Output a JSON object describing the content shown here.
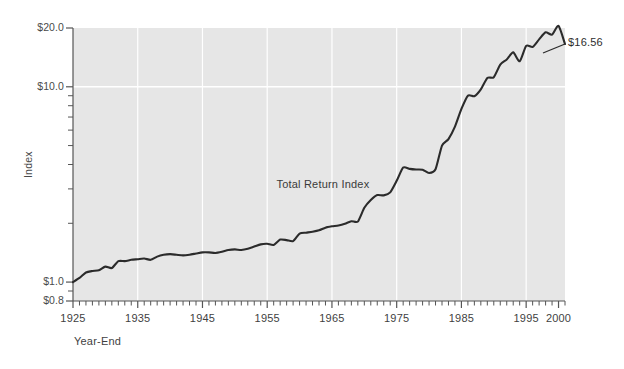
{
  "chart_data": {
    "type": "line",
    "title": "",
    "subtitle": "",
    "xlabel": "Year-End",
    "ylabel": "Index",
    "yscale": "log",
    "ylim": [
      0.8,
      20.0
    ],
    "xlim": [
      1925,
      2001
    ],
    "grid": true,
    "legend_position": "none",
    "y_ticks_major": [
      "$20.0",
      "$10.0",
      "$1.0",
      "$0.8"
    ],
    "y_tick_values": [
      20.0,
      10.0,
      1.0,
      0.8
    ],
    "y_ticks_minor_values": [
      9,
      8,
      7,
      6,
      5,
      4,
      3,
      2,
      0.9
    ],
    "x_ticks_major": [
      "1925",
      "1935",
      "1945",
      "1955",
      "1965",
      "1975",
      "1985",
      "1995",
      "2000"
    ],
    "x_tick_values": [
      1925,
      1935,
      1945,
      1955,
      1965,
      1975,
      1985,
      1995,
      2000
    ],
    "x_minor_tick_interval": 1,
    "gridline_years": [
      1935,
      1945,
      1955,
      1965,
      1975,
      1985,
      1995
    ],
    "gridline_values": [
      10.0
    ],
    "annotations": [
      {
        "text": "Total Return Index",
        "x": 1964,
        "y": 3.1
      },
      {
        "text": "$16.56",
        "x": 2001,
        "y": 16.56
      }
    ],
    "series": [
      {
        "name": "Total Return Index",
        "color": "#2b2b2b",
        "x": [
          1925,
          1926,
          1927,
          1928,
          1929,
          1930,
          1931,
          1932,
          1933,
          1934,
          1935,
          1936,
          1937,
          1938,
          1939,
          1940,
          1941,
          1942,
          1943,
          1944,
          1945,
          1946,
          1947,
          1948,
          1949,
          1950,
          1951,
          1952,
          1953,
          1954,
          1955,
          1956,
          1957,
          1958,
          1959,
          1960,
          1961,
          1962,
          1963,
          1964,
          1965,
          1966,
          1967,
          1968,
          1969,
          1970,
          1971,
          1972,
          1973,
          1974,
          1975,
          1976,
          1977,
          1978,
          1979,
          1980,
          1981,
          1982,
          1983,
          1984,
          1985,
          1986,
          1987,
          1988,
          1989,
          1990,
          1991,
          1992,
          1993,
          1994,
          1995,
          1996,
          1997,
          1998,
          1999,
          2000,
          2001
        ],
        "values": [
          1.0,
          1.05,
          1.12,
          1.14,
          1.15,
          1.2,
          1.18,
          1.28,
          1.28,
          1.3,
          1.31,
          1.32,
          1.3,
          1.35,
          1.38,
          1.39,
          1.38,
          1.37,
          1.38,
          1.4,
          1.42,
          1.42,
          1.41,
          1.43,
          1.46,
          1.47,
          1.46,
          1.48,
          1.52,
          1.56,
          1.57,
          1.55,
          1.65,
          1.64,
          1.62,
          1.77,
          1.79,
          1.81,
          1.84,
          1.9,
          1.93,
          1.95,
          1.99,
          2.05,
          2.04,
          2.4,
          2.63,
          2.79,
          2.78,
          2.88,
          3.3,
          3.86,
          3.8,
          3.77,
          3.76,
          3.62,
          3.78,
          5.0,
          5.4,
          6.25,
          7.7,
          9.0,
          8.95,
          9.7,
          11.1,
          11.2,
          13.0,
          13.8,
          15.0,
          13.5,
          16.2,
          16.0,
          17.5,
          19.0,
          18.5,
          20.5,
          16.56
        ]
      }
    ]
  },
  "axis": {
    "y_title": "Index",
    "x_title": "Year-End"
  },
  "colors": {
    "plot_background": "#e6e6e6",
    "gridline": "#ffffff",
    "axis_line": "#555555",
    "series_line": "#2b2b2b",
    "page_background": "#ffffff",
    "text": "#3f3f3f"
  }
}
